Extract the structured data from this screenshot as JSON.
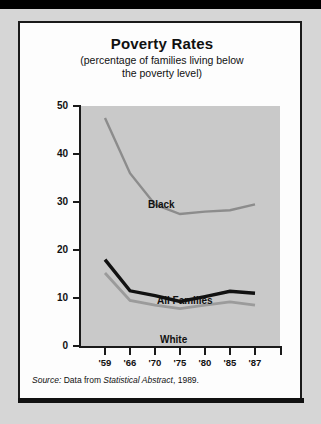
{
  "figure": {
    "title": "Poverty Rates",
    "subtitle_line1": "(percentage of families living below",
    "subtitle_line2": "the poverty level)",
    "source_prefix": "Source:",
    "source_mid": " Data from ",
    "source_italic": "Statistical Abstract",
    "source_suffix": ", 1989."
  },
  "colors": {
    "page_background": "#d6d6d6",
    "card_background": "#fdfdfd",
    "plot_background": "#c9c9c9",
    "axis": "#1a1a1a",
    "series_black": "#8c8c8c",
    "series_all_families": "#111111",
    "series_white": "#9b9b9b"
  },
  "chart_data": {
    "type": "line",
    "title": "Poverty Rates",
    "subtitle": "(percentage of families living below the poverty level)",
    "xlabel": "",
    "ylabel": "",
    "x": [
      "'59",
      "'66",
      "'70",
      "'75",
      "'80",
      "'85",
      "'87"
    ],
    "xtick_labels": [
      "'59",
      "'66",
      "'70",
      "'75",
      "'80",
      "'85",
      "'87"
    ],
    "ytick_labels": [
      "0",
      "10",
      "20",
      "30",
      "40",
      "50"
    ],
    "ytick_values": [
      0,
      10,
      20,
      30,
      40,
      50
    ],
    "ylim": [
      0,
      50
    ],
    "grid": false,
    "legend": "inline-annotations",
    "series": [
      {
        "name": "Black",
        "color": "#8c8c8c",
        "values": [
          47.5,
          36.0,
          29.5,
          27.5,
          28.0,
          28.3,
          29.5
        ]
      },
      {
        "name": "All Families",
        "color": "#111111",
        "values": [
          18.0,
          11.5,
          10.5,
          9.3,
          10.3,
          11.4,
          11.0
        ]
      },
      {
        "name": "White",
        "color": "#9b9b9b",
        "values": [
          15.2,
          9.5,
          8.5,
          7.8,
          8.5,
          9.2,
          8.5
        ]
      }
    ],
    "annotations": [
      {
        "text": "Black",
        "x": "'70",
        "y": 34
      },
      {
        "text": "All Families",
        "x": "'75",
        "y": 14
      },
      {
        "text": "White",
        "x": "'75",
        "y": 5.5
      }
    ],
    "source": "Source: Data from Statistical Abstract, 1989."
  }
}
